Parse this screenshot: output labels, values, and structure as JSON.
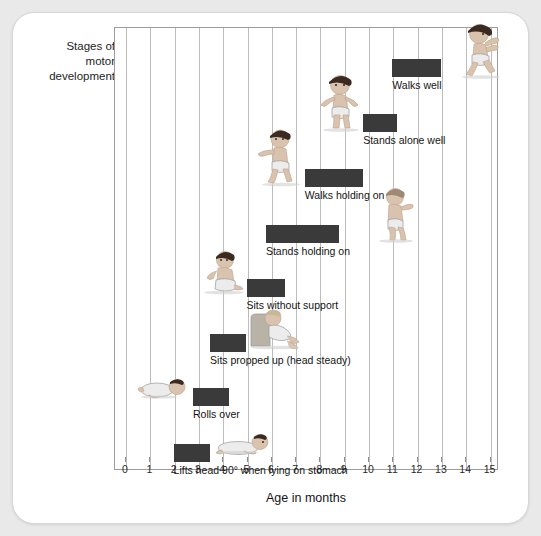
{
  "axes": {
    "y_title": "Stages of\nmotor\ndevelopment",
    "x_title": "Age in months",
    "x_ticks": [
      "0",
      "1",
      "2",
      "3",
      "4",
      "5",
      "6",
      "7",
      "8",
      "9",
      "10",
      "11",
      "12",
      "13",
      "14",
      "15"
    ]
  },
  "colors": {
    "bar": "#3a3a3a",
    "grid": "#bcbcbc",
    "frame": "#9c9c9c",
    "card": "#ffffff",
    "page": "#e9e9e9",
    "text": "#141414"
  },
  "chart_data": {
    "type": "bar",
    "orientation": "horizontal",
    "title": "",
    "xlabel": "Age in months",
    "ylabel": "Stages of motor development",
    "xlim": [
      0,
      15
    ],
    "grid": true,
    "legend": false,
    "categories": [
      "Lifts head 90° when lying on stomach",
      "Rolls over",
      "Sits propped up (head steady)",
      "Sits without support",
      "Stands holding on",
      "Walks holding on",
      "Stands alone well",
      "Walks well"
    ],
    "ranges": [
      {
        "label": "Lifts head 90° when lying on stomach",
        "start": 2.0,
        "end": 3.5,
        "figure": "baby-lifting-head"
      },
      {
        "label": "Rolls over",
        "start": 2.8,
        "end": 4.3,
        "figure": "baby-rolling-over"
      },
      {
        "label": "Sits propped up (head steady)",
        "start": 3.5,
        "end": 5.0,
        "figure": "baby-propped-up"
      },
      {
        "label": "Sits without support",
        "start": 5.0,
        "end": 6.6,
        "figure": "baby-sitting"
      },
      {
        "label": "Stands holding on",
        "start": 5.8,
        "end": 8.8,
        "figure": "baby-standing-holding"
      },
      {
        "label": "Walks holding on",
        "start": 7.4,
        "end": 9.8,
        "figure": "baby-walking-holding"
      },
      {
        "label": "Stands alone well",
        "start": 9.8,
        "end": 11.2,
        "figure": "toddler-standing"
      },
      {
        "label": "Walks well",
        "start": 11.0,
        "end": 13.0,
        "figure": "toddler-walking"
      }
    ]
  }
}
